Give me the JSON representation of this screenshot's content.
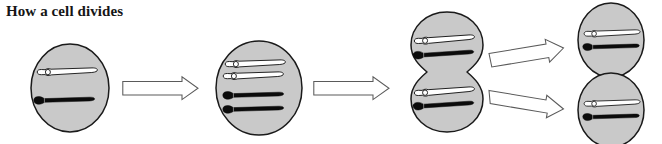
{
  "figure": {
    "title": "How a cell divides",
    "background_color": "#ffffff",
    "title_color": "#161616"
  },
  "style": {
    "cell_fill": "#c9c9c9",
    "cell_stroke": "#1a1a1a",
    "chromosome_light_fill": "#ffffff",
    "chromosome_light_stroke": "#1a1a1a",
    "chromosome_dark_fill": "#0b0b0b",
    "chromosome_dark_stroke": "#0b0b0b",
    "arrow_fill": "#ffffff",
    "arrow_stroke": "#4a4a4a"
  },
  "stages": [
    {
      "id": "stage-1",
      "label": "Parent cell",
      "shape": "single-ellipse",
      "chromosome_count": 2,
      "chromosomes": [
        {
          "color": "light",
          "label": "light-chromosome"
        },
        {
          "color": "dark",
          "label": "dark-chromosome"
        }
      ]
    },
    {
      "id": "stage-2",
      "label": "Chromosomes duplicated",
      "shape": "single-ellipse",
      "chromosome_count": 4,
      "chromosomes": [
        {
          "color": "light",
          "label": "light-chromosome-copy-1"
        },
        {
          "color": "light",
          "label": "light-chromosome-copy-2"
        },
        {
          "color": "dark",
          "label": "dark-chromosome-copy-1"
        },
        {
          "color": "dark",
          "label": "dark-chromosome-copy-2"
        }
      ]
    },
    {
      "id": "stage-3",
      "label": "Cell splitting",
      "shape": "pinched-double-ellipse",
      "chromosome_count": 4,
      "chromosomes": [
        {
          "color": "light",
          "label": "upper-light-chromosome"
        },
        {
          "color": "dark",
          "label": "upper-dark-chromosome"
        },
        {
          "color": "light",
          "label": "lower-light-chromosome"
        },
        {
          "color": "dark",
          "label": "lower-dark-chromosome"
        }
      ]
    },
    {
      "id": "stage-4-top",
      "label": "Daughter cell one",
      "shape": "single-ellipse",
      "chromosome_count": 2,
      "chromosomes": [
        {
          "color": "light",
          "label": "light-chromosome"
        },
        {
          "color": "dark",
          "label": "dark-chromosome"
        }
      ]
    },
    {
      "id": "stage-4-bottom",
      "label": "Daughter cell two",
      "shape": "single-ellipse",
      "chromosome_count": 2,
      "chromosomes": [
        {
          "color": "light",
          "label": "light-chromosome"
        },
        {
          "color": "dark",
          "label": "dark-chromosome"
        }
      ]
    }
  ],
  "arrows": [
    {
      "id": "arrow-1",
      "from": "stage-1",
      "to": "stage-2",
      "direction": "right",
      "style": "outlined-block-arrow"
    },
    {
      "id": "arrow-2",
      "from": "stage-2",
      "to": "stage-3",
      "direction": "right",
      "style": "outlined-block-arrow"
    },
    {
      "id": "arrow-3",
      "from": "stage-3",
      "to": "stage-4-top",
      "direction": "up-right",
      "style": "outlined-block-arrow"
    },
    {
      "id": "arrow-4",
      "from": "stage-3",
      "to": "stage-4-bottom",
      "direction": "down-right",
      "style": "outlined-block-arrow"
    }
  ]
}
